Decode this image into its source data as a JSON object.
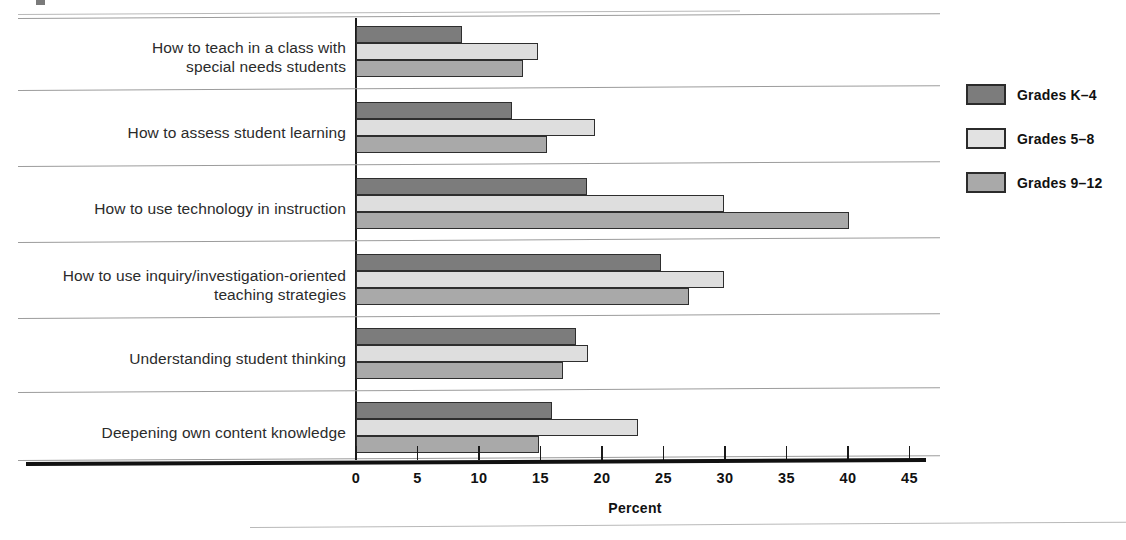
{
  "chart_data": {
    "type": "bar",
    "orientation": "horizontal",
    "title": "",
    "xlabel": "Percent",
    "ylabel": "",
    "xlim": [
      0,
      47
    ],
    "grid": false,
    "legend_position": "right",
    "xticks": [
      "0",
      "5",
      "10",
      "15",
      "20",
      "25",
      "30",
      "35",
      "40",
      "45"
    ],
    "xtick_values": [
      0,
      5,
      10,
      15,
      20,
      25,
      30,
      35,
      40,
      45
    ],
    "categories": [
      "How to teach in a class with\nspecial needs students",
      "How to assess student learning",
      "How to use technology in instruction",
      "How to use inquiry/investigation-oriented\nteaching strategies",
      "Understanding student thinking",
      "Deepening own content knowledge"
    ],
    "series": [
      {
        "name": "Grades K–4",
        "color": "#7c7c7c",
        "values": [
          8.6,
          12.7,
          18.8,
          24.8,
          17.9,
          15.9
        ]
      },
      {
        "name": "Grades 5–8",
        "color": "#dedede",
        "values": [
          14.8,
          19.4,
          29.9,
          29.9,
          18.9,
          22.9
        ]
      },
      {
        "name": "Grades 9–12",
        "color": "#a9a9a9",
        "values": [
          13.6,
          15.5,
          40.1,
          27.1,
          16.8,
          14.9
        ]
      }
    ]
  },
  "legend": {
    "items": [
      {
        "label": "Grades K–4"
      },
      {
        "label": "Grades 5–8"
      },
      {
        "label": "Grades 9–12"
      }
    ]
  },
  "axis": {
    "title": "Percent"
  }
}
